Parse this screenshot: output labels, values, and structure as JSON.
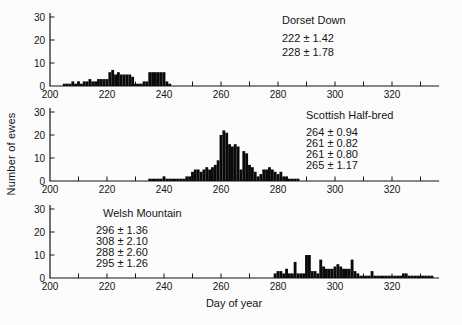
{
  "figure": {
    "background": "#fcfcfc",
    "ink_color": "#141414",
    "bar_color": "#0a0a0a"
  },
  "chart_data": {
    "type": "bar",
    "subtype": "histogram",
    "xlabel": "Day of year",
    "ylabel": "Number of ewes",
    "xlim": [
      200,
      336
    ],
    "ylim": [
      0,
      30
    ],
    "x_major_ticks": [
      200,
      220,
      240,
      260,
      280,
      300,
      320
    ],
    "x_minor_tick_step": 10,
    "x_minor_tick_range": [
      210,
      330
    ],
    "y_ticks": [
      0,
      10,
      20,
      30
    ],
    "bin_width_days": 1,
    "grid": "off",
    "legend": "none",
    "panels": [
      {
        "title": "Dorset Down",
        "annotations": [
          "222 ± 1.42",
          "228 ± 1.78"
        ],
        "note_x": 282,
        "note_y": 15,
        "note_line_h": 14,
        "title_indent": 0,
        "title_gap": 5,
        "bins": [
          [
            205,
            1
          ],
          [
            206,
            1
          ],
          [
            207,
            1
          ],
          [
            208,
            2
          ],
          [
            209,
            1
          ],
          [
            210,
            2
          ],
          [
            211,
            1
          ],
          [
            212,
            2
          ],
          [
            213,
            2
          ],
          [
            214,
            3
          ],
          [
            215,
            2
          ],
          [
            216,
            2
          ],
          [
            217,
            3
          ],
          [
            218,
            3
          ],
          [
            219,
            3
          ],
          [
            220,
            3
          ],
          [
            221,
            6
          ],
          [
            222,
            7
          ],
          [
            223,
            5
          ],
          [
            224,
            6
          ],
          [
            225,
            5
          ],
          [
            226,
            5
          ],
          [
            227,
            5
          ],
          [
            228,
            5
          ],
          [
            229,
            4
          ],
          [
            230,
            1
          ],
          [
            231,
            1
          ],
          [
            232,
            1
          ],
          [
            233,
            2
          ],
          [
            234,
            2
          ],
          [
            235,
            6
          ],
          [
            236,
            6
          ],
          [
            237,
            6
          ],
          [
            238,
            6
          ],
          [
            239,
            6
          ],
          [
            240,
            6
          ],
          [
            241,
            2
          ],
          [
            242,
            1
          ]
        ]
      },
      {
        "title": "Scottish Half-bred",
        "annotations": [
          "264 ± 0.94",
          "261 ± 0.82",
          "261 ± 0.80",
          "265 ± 1.17"
        ],
        "note_x": 306,
        "note_y": 110,
        "note_line_h": 11,
        "title_indent": 0,
        "title_gap": 6,
        "bins": [
          [
            235,
            1
          ],
          [
            236,
            1
          ],
          [
            237,
            1
          ],
          [
            238,
            1
          ],
          [
            239,
            1
          ],
          [
            240,
            2
          ],
          [
            241,
            1
          ],
          [
            242,
            1
          ],
          [
            243,
            1
          ],
          [
            244,
            1
          ],
          [
            245,
            1
          ],
          [
            246,
            1
          ],
          [
            247,
            1
          ],
          [
            248,
            2
          ],
          [
            249,
            2
          ],
          [
            250,
            4
          ],
          [
            251,
            5
          ],
          [
            252,
            5
          ],
          [
            253,
            4
          ],
          [
            254,
            5
          ],
          [
            255,
            6
          ],
          [
            256,
            5
          ],
          [
            257,
            6
          ],
          [
            258,
            7
          ],
          [
            259,
            9
          ],
          [
            260,
            20
          ],
          [
            261,
            22
          ],
          [
            262,
            21
          ],
          [
            263,
            16
          ],
          [
            264,
            15
          ],
          [
            265,
            16
          ],
          [
            266,
            15
          ],
          [
            267,
            5
          ],
          [
            268,
            13
          ],
          [
            269,
            12
          ],
          [
            270,
            7
          ],
          [
            271,
            6
          ],
          [
            272,
            4
          ],
          [
            273,
            2
          ],
          [
            274,
            3
          ],
          [
            275,
            5
          ],
          [
            276,
            5
          ],
          [
            277,
            6
          ],
          [
            278,
            5
          ],
          [
            279,
            4
          ],
          [
            280,
            3
          ],
          [
            281,
            4
          ],
          [
            282,
            2
          ],
          [
            283,
            2
          ],
          [
            284,
            1
          ],
          [
            285,
            1
          ],
          [
            286,
            1
          ],
          [
            287,
            1
          ]
        ]
      },
      {
        "title": "Welsh Mountain",
        "annotations": [
          "296 ± 1.36",
          "308 ± 2.10",
          "288 ± 2.60",
          "295 ± 1.26"
        ],
        "note_x": 96,
        "note_y": 208,
        "note_line_h": 11,
        "title_indent": 7,
        "title_gap": 6,
        "bins": [
          [
            279,
            2
          ],
          [
            280,
            3
          ],
          [
            281,
            3
          ],
          [
            282,
            2
          ],
          [
            283,
            4
          ],
          [
            284,
            2
          ],
          [
            285,
            2
          ],
          [
            286,
            7
          ],
          [
            287,
            2
          ],
          [
            288,
            2
          ],
          [
            289,
            2
          ],
          [
            290,
            10
          ],
          [
            291,
            10
          ],
          [
            292,
            3
          ],
          [
            293,
            3
          ],
          [
            294,
            2
          ],
          [
            295,
            8
          ],
          [
            296,
            5
          ],
          [
            297,
            4
          ],
          [
            298,
            4
          ],
          [
            299,
            4
          ],
          [
            300,
            5
          ],
          [
            301,
            6
          ],
          [
            302,
            5
          ],
          [
            303,
            4
          ],
          [
            304,
            4
          ],
          [
            305,
            4
          ],
          [
            306,
            8
          ],
          [
            307,
            3
          ],
          [
            308,
            2
          ],
          [
            309,
            1
          ],
          [
            310,
            1
          ],
          [
            311,
            1
          ],
          [
            312,
            1
          ],
          [
            313,
            3
          ],
          [
            314,
            1
          ],
          [
            315,
            1
          ],
          [
            316,
            1
          ],
          [
            317,
            1
          ],
          [
            318,
            1
          ],
          [
            319,
            1
          ],
          [
            320,
            1
          ],
          [
            321,
            1
          ],
          [
            322,
            1
          ],
          [
            323,
            1
          ],
          [
            324,
            2
          ],
          [
            325,
            2
          ],
          [
            326,
            1
          ],
          [
            327,
            1
          ],
          [
            328,
            1
          ],
          [
            329,
            1
          ],
          [
            330,
            1
          ],
          [
            331,
            1
          ],
          [
            332,
            1
          ],
          [
            333,
            1
          ],
          [
            334,
            1
          ]
        ]
      }
    ]
  }
}
